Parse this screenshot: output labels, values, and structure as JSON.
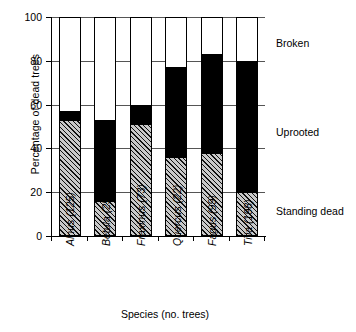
{
  "chart_data": {
    "type": "bar",
    "subtype": "stacked-vertical",
    "title": "",
    "xlabel": "Species (no. trees)",
    "ylabel": "Percentage of dead trees",
    "ylim": [
      0,
      100
    ],
    "yticks": [
      0,
      20,
      40,
      60,
      80,
      100
    ],
    "ytick_labels": [
      "0",
      "20",
      "40",
      "60",
      "80",
      "100"
    ],
    "grid": true,
    "grid_axis": "y",
    "legend_position": "right-inline",
    "categories": [
      "Alnus (125)",
      "Betula (255)",
      "Fraxinus (73)",
      "Quercus (22)",
      "Fagus (99)",
      "Tilia (198)"
    ],
    "series": [
      {
        "name": "Standing dead",
        "fill": "hatched",
        "color": "#c9c9c9",
        "values": [
          53,
          16,
          51,
          36,
          38,
          20
        ]
      },
      {
        "name": "Uprooted",
        "fill": "solid-black",
        "color": "#000000",
        "values": [
          4,
          37,
          9,
          41,
          45,
          60
        ]
      },
      {
        "name": "Broken",
        "fill": "white",
        "color": "#ffffff",
        "values": [
          43,
          47,
          40,
          23,
          17,
          20
        ]
      }
    ],
    "cumulative_tops": {
      "standing_dead": [
        53,
        16,
        51,
        36,
        38,
        20
      ],
      "uprooted": [
        57,
        53,
        60,
        77,
        83,
        80
      ],
      "broken": [
        100,
        100,
        100,
        100,
        100,
        100
      ]
    },
    "annotations": [
      {
        "label": "Broken",
        "y": 91
      },
      {
        "label": "Uprooted",
        "y": 50
      },
      {
        "label": "Standing dead",
        "y": 14
      }
    ]
  }
}
